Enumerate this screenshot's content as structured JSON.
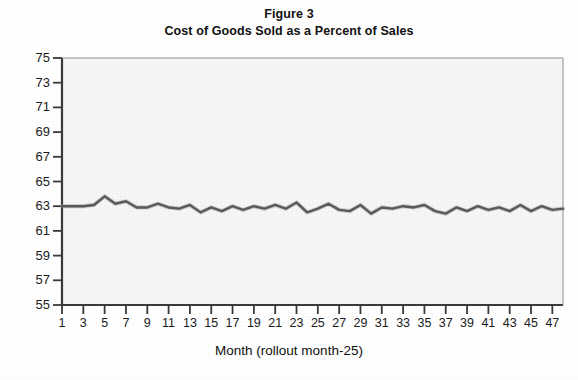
{
  "figure": {
    "title_line1": "Figure 3",
    "title_line2": "Cost of Goods Sold as a Percent of Sales"
  },
  "axes": {
    "xlabel": "Month (rollout month-25)",
    "ylabel": "",
    "y_ticks": [
      "75",
      "73",
      "71",
      "69",
      "67",
      "65",
      "63",
      "61",
      "59",
      "57",
      "55"
    ],
    "x_ticks": [
      "1",
      "3",
      "5",
      "7",
      "9",
      "11",
      "13",
      "15",
      "17",
      "19",
      "21",
      "23",
      "25",
      "27",
      "29",
      "31",
      "33",
      "35",
      "37",
      "39",
      "41",
      "43",
      "45",
      "47"
    ]
  },
  "colors": {
    "line": "#5a5a5a",
    "axis": "#3a3a3a",
    "plot_background": "#f6f6f6",
    "text": "#111111"
  },
  "chart_data": {
    "type": "line",
    "title": "Cost of Goods Sold as a Percent of Sales",
    "subtitle": "Figure 3",
    "xlabel": "Month (rollout month-25)",
    "ylabel": "",
    "xlim": [
      1,
      48
    ],
    "ylim": [
      55,
      75
    ],
    "ytick_step": 2,
    "grid": false,
    "legend": "none",
    "x": [
      1,
      2,
      3,
      4,
      5,
      6,
      7,
      8,
      9,
      10,
      11,
      12,
      13,
      14,
      15,
      16,
      17,
      18,
      19,
      20,
      21,
      22,
      23,
      24,
      25,
      26,
      27,
      28,
      29,
      30,
      31,
      32,
      33,
      34,
      35,
      36,
      37,
      38,
      39,
      40,
      41,
      42,
      43,
      44,
      45,
      46,
      47,
      48
    ],
    "series": [
      {
        "name": "Cost of goods sold (% of sales)",
        "values": [
          63.0,
          63.0,
          63.0,
          63.1,
          63.8,
          63.2,
          63.4,
          62.9,
          62.9,
          63.2,
          62.9,
          62.8,
          63.1,
          62.5,
          62.9,
          62.6,
          63.0,
          62.7,
          63.0,
          62.8,
          63.1,
          62.8,
          63.3,
          62.5,
          62.8,
          63.2,
          62.7,
          62.6,
          63.1,
          62.4,
          62.9,
          62.8,
          63.0,
          62.9,
          63.1,
          62.6,
          62.4,
          62.9,
          62.6,
          63.0,
          62.7,
          62.9,
          62.6,
          63.1,
          62.6,
          63.0,
          62.7,
          62.8
        ]
      }
    ]
  }
}
